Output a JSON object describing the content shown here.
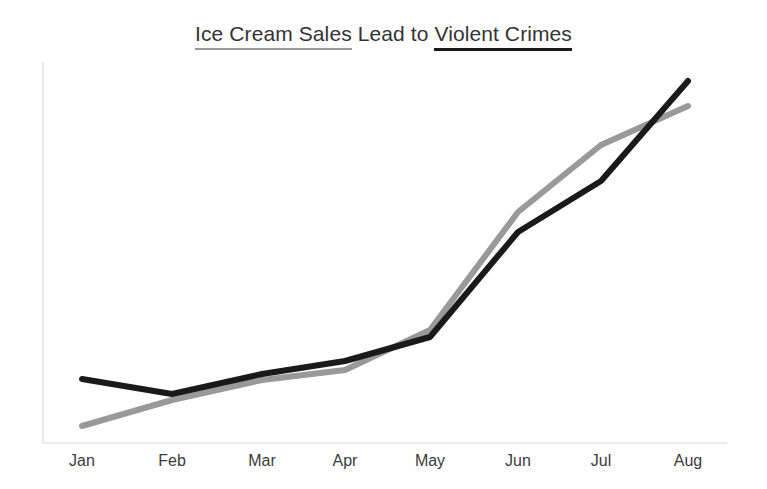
{
  "chart_data": {
    "type": "line",
    "title": "Ice Cream Sales Lead to Violent Crimes",
    "title_segments": [
      {
        "text": "Ice Cream Sales",
        "underline_color": "#999999"
      },
      {
        "text": " Lead to ",
        "underline_color": "none"
      },
      {
        "text": "Violent Crimes",
        "underline_color": "#1a1a1a"
      }
    ],
    "xlabel": "",
    "ylabel": "",
    "categories": [
      "Jan",
      "Feb",
      "Mar",
      "Apr",
      "May",
      "Jun",
      "Jul",
      "Aug"
    ],
    "grid": false,
    "legend": "none",
    "ylim": [
      0,
      100
    ],
    "xlim": [
      0,
      7
    ],
    "series": [
      {
        "name": "Ice Cream Sales",
        "color": "#999999",
        "stroke_width": 6,
        "values": [
          4,
          12,
          17,
          20,
          30,
          62,
          77,
          92
        ]
      },
      {
        "name": "Violent Crimes",
        "color": "#1a1a1a",
        "stroke_width": 6,
        "values": [
          17,
          13,
          19,
          23,
          28,
          55,
          69,
          95
        ]
      }
    ],
    "pixel_geometry": {
      "x_positions": [
        82,
        172,
        262,
        345,
        430,
        518,
        601,
        688
      ],
      "series_pixel_y": {
        "Ice Cream Sales": [
          426,
          400,
          380,
          370,
          330,
          212,
          145,
          106
        ],
        "Violent Crimes": [
          379,
          394,
          374,
          361,
          337,
          232,
          181,
          81
        ]
      },
      "axis": {
        "x_axis_y": 443,
        "y_axis_x": 43,
        "y_axis_top": 62,
        "x_axis_right": 727,
        "color": "#d8d8d8"
      },
      "x_label_y": 452
    }
  },
  "colors": {
    "background": "#ffffff",
    "title_text": "#333333",
    "tick_text": "#3b3b3b",
    "axis": "#d8d8d8",
    "gray_series": "#999999",
    "black_series": "#1a1a1a"
  }
}
